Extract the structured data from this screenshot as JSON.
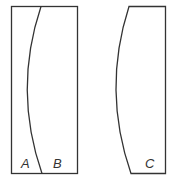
{
  "figure": {
    "labels": {
      "a": "A",
      "b": "B",
      "c": "C"
    },
    "stroke_color": "#333333",
    "background": "#ffffff"
  }
}
